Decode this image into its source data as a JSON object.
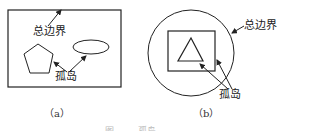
{
  "diagram": {
    "panel_a": {
      "label_boundary": "总边界",
      "label_island": "孤岛",
      "caption": "（a）",
      "shapes": [
        "rectangle-boundary",
        "pentagon",
        "ellipse"
      ]
    },
    "panel_b": {
      "label_boundary": "总边界",
      "label_island": "孤岛",
      "caption": "（b）",
      "shapes": [
        "circle-boundary",
        "square",
        "triangle"
      ]
    },
    "figure_caption": "图 —— 孤岛"
  },
  "colors": {
    "stroke": "#222222",
    "background": "#ffffff"
  }
}
